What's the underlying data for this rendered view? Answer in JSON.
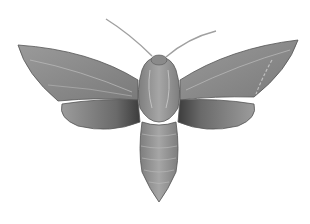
{
  "image": {
    "subject": "hawk moth illustration",
    "background_color": "#ffffff",
    "colors": {
      "wing": "#8c8c8c",
      "wing_dark": "#5a5a5a",
      "body": "#969696",
      "outline": "#555555",
      "antenna": "#9a9a9a"
    }
  }
}
